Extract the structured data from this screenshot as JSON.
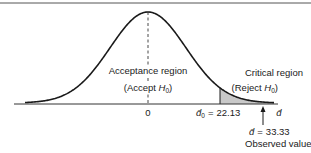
{
  "diagram": {
    "type": "hypothesis-test-normal-curve",
    "regions": {
      "acceptance": {
        "label": "Acceptance region",
        "sublabel_prefix": "(Accept ",
        "sublabel_var": "H",
        "sublabel_sub": "0",
        "sublabel_suffix": ")"
      },
      "critical": {
        "label": "Critical region",
        "sublabel_prefix": "(Reject ",
        "sublabel_var": "H",
        "sublabel_sub": "0",
        "sublabel_suffix": ")"
      }
    },
    "axis": {
      "center_tick_label": "0",
      "axis_variable": "d̄",
      "critical_value": {
        "symbol": "d̄",
        "subscript": "0",
        "equals": "=",
        "value": "22.13"
      },
      "observed_value": {
        "symbol": "d̄",
        "equals": "=",
        "value": "33.33",
        "caption": "Observed value"
      }
    },
    "colors": {
      "curve": "#1a1a1a",
      "shade": "#c9c9c9",
      "axis": "#333333"
    }
  }
}
